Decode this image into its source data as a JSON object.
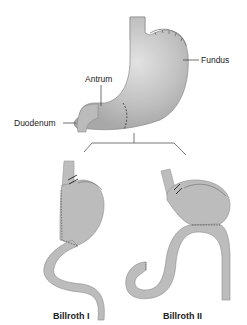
{
  "diagram": {
    "type": "anatomical-illustration",
    "labels": {
      "fundus": "Fundus",
      "antrum": "Antrum",
      "duodenum": "Duodenum"
    },
    "procedures": [
      {
        "id": "billroth-1",
        "caption": "Billroth I"
      },
      {
        "id": "billroth-2",
        "caption": "Billroth II"
      }
    ],
    "colors": {
      "organ_fill": "#b9b9b9",
      "organ_highlight": "#dcdcdc",
      "outline": "#8a8a8a",
      "suture": "#555555",
      "text": "#222222",
      "background": "#ffffff"
    }
  }
}
